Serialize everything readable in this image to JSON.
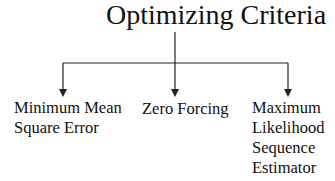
{
  "diagram": {
    "title": "Optimizing Criteria",
    "children": [
      {
        "id": "mmse",
        "lines": [
          "Minimum Mean",
          "Square Error"
        ]
      },
      {
        "id": "zf",
        "lines": [
          "Zero Forcing"
        ]
      },
      {
        "id": "mlse",
        "lines": [
          "Maximum",
          "Likelihood",
          "Sequence",
          "Estimator"
        ]
      }
    ],
    "line_color": "#222222"
  }
}
